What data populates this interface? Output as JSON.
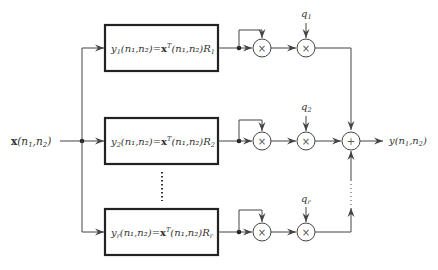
{
  "diagram": {
    "input": {
      "label_bold": "x",
      "label_args": "(n",
      "sub1": "1",
      "comma": ",n",
      "sub2": "2",
      "close": ")"
    },
    "output": {
      "label": "y",
      "label_args": "(n",
      "sub1": "1",
      "comma": ",n",
      "sub2": "2",
      "close": ")"
    },
    "branches": [
      {
        "y_label": "y",
        "index": "1",
        "eq_mid": "(n₁,n₂)=",
        "x_bold": "x",
        "sup": "T",
        "eq_tail": "(n₁,n₂)R",
        "r_sub": "1",
        "q_label": "q",
        "q_sub": "1"
      },
      {
        "y_label": "y",
        "index": "2",
        "eq_mid": "(n₁,n₂)=",
        "x_bold": "x",
        "sup": "T",
        "eq_tail": "(n₁,n₂)R",
        "r_sub": "2",
        "q_label": "q",
        "q_sub": "2"
      },
      {
        "y_label": "y",
        "index": "r",
        "eq_mid": "(n₁,n₂)=",
        "x_bold": "x",
        "sup": "T",
        "eq_tail": "(n₁,n₂)R",
        "r_sub": "r",
        "q_label": "q",
        "q_sub": "r"
      }
    ],
    "operators": {
      "multiply": "×",
      "add": "+"
    },
    "colors": {
      "line": "#444444",
      "box": "#222222",
      "text": "#333333"
    }
  }
}
